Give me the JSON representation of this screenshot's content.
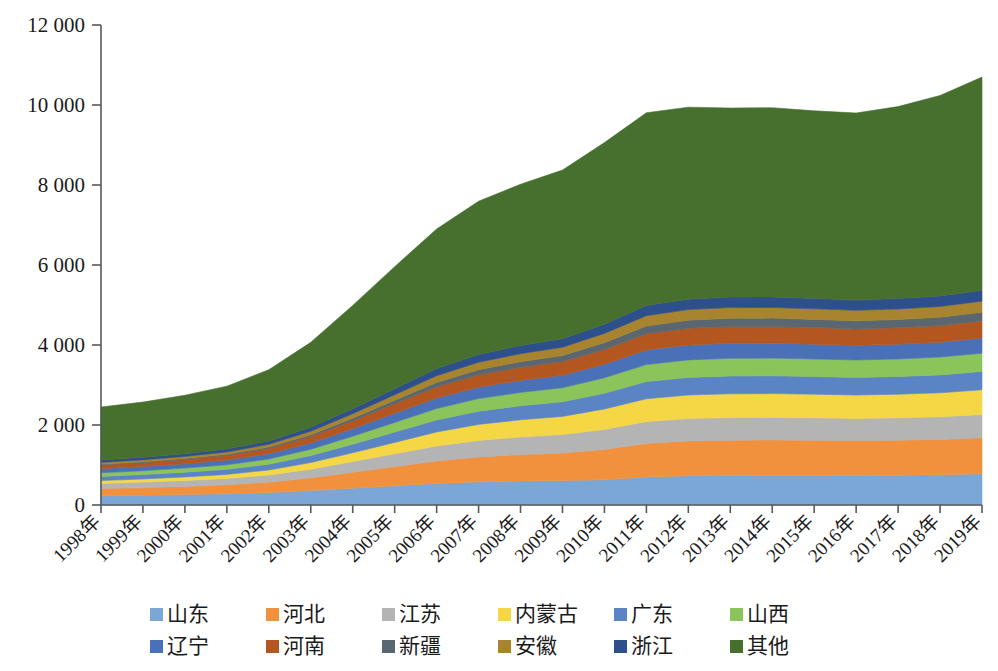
{
  "chart_data": {
    "type": "area",
    "stacked": true,
    "title": "",
    "xlabel": "",
    "ylabel": "",
    "ylim": [
      0,
      12000
    ],
    "ytick_labels": [
      "0",
      "2 000",
      "4 000",
      "6 000",
      "8 000",
      "10 000",
      "12 000"
    ],
    "ytick_values": [
      0,
      2000,
      4000,
      6000,
      8000,
      10000,
      12000
    ],
    "grid": false,
    "legend_position": "bottom",
    "categories": [
      "1998年",
      "1999年",
      "2000年",
      "2001年",
      "2002年",
      "2003年",
      "2004年",
      "2005年",
      "2006年",
      "2007年",
      "2008年",
      "2009年",
      "2010年",
      "2011年",
      "2012年",
      "2013年",
      "2014年",
      "2015年",
      "2016年",
      "2017年",
      "2018年",
      "2019年"
    ],
    "x_values": [
      1998,
      1999,
      2000,
      2001,
      2002,
      2003,
      2004,
      2005,
      2006,
      2007,
      2008,
      2009,
      2010,
      2011,
      2012,
      2013,
      2014,
      2015,
      2016,
      2017,
      2018,
      2019
    ],
    "series": [
      {
        "name": "山东",
        "color": "#7ba7d7",
        "values": [
          230,
          245,
          260,
          280,
          310,
          360,
          420,
          480,
          540,
          580,
          600,
          610,
          630,
          700,
          730,
          740,
          745,
          745,
          740,
          745,
          755,
          780
        ]
      },
      {
        "name": "河北",
        "color": "#f2913d",
        "values": [
          180,
          190,
          205,
          225,
          260,
          320,
          400,
          480,
          560,
          620,
          660,
          690,
          760,
          840,
          870,
          880,
          880,
          875,
          870,
          875,
          885,
          900
        ]
      },
      {
        "name": "江苏",
        "color": "#b4b4b4",
        "values": [
          130,
          138,
          148,
          160,
          180,
          215,
          265,
          320,
          375,
          415,
          440,
          460,
          500,
          545,
          560,
          565,
          565,
          560,
          555,
          560,
          565,
          580
        ]
      },
      {
        "name": "内蒙古",
        "color": "#f5d644",
        "values": [
          70,
          78,
          88,
          100,
          125,
          165,
          220,
          285,
          350,
          400,
          430,
          455,
          510,
          570,
          590,
          595,
          595,
          590,
          585,
          590,
          600,
          620
        ]
      },
      {
        "name": "广东",
        "color": "#5a84c4",
        "values": [
          105,
          110,
          118,
          128,
          145,
          175,
          215,
          258,
          300,
          330,
          350,
          365,
          395,
          430,
          440,
          445,
          445,
          442,
          440,
          443,
          448,
          460
        ]
      },
      {
        "name": "山西",
        "color": "#8bc45a",
        "values": [
          90,
          95,
          103,
          113,
          130,
          158,
          197,
          240,
          285,
          315,
          335,
          352,
          385,
          425,
          438,
          442,
          442,
          438,
          435,
          438,
          444,
          455
        ]
      },
      {
        "name": "辽宁",
        "color": "#4a71b8",
        "values": [
          100,
          104,
          110,
          118,
          132,
          158,
          192,
          228,
          262,
          285,
          300,
          312,
          336,
          365,
          373,
          375,
          374,
          370,
          366,
          368,
          372,
          380
        ]
      },
      {
        "name": "河南",
        "color": "#b4561f",
        "values": [
          95,
          100,
          107,
          116,
          132,
          160,
          198,
          240,
          282,
          310,
          328,
          342,
          370,
          405,
          416,
          420,
          419,
          415,
          411,
          413,
          418,
          428
        ]
      },
      {
        "name": "新疆",
        "color": "#5a6670",
        "values": [
          18,
          20,
          23,
          27,
          34,
          46,
          64,
          86,
          110,
          128,
          140,
          150,
          172,
          196,
          204,
          207,
          207,
          205,
          203,
          205,
          209,
          216
        ]
      },
      {
        "name": "安徽",
        "color": "#a8842f",
        "values": [
          45,
          48,
          52,
          58,
          68,
          85,
          110,
          138,
          166,
          186,
          198,
          208,
          230,
          256,
          264,
          267,
          267,
          264,
          262,
          264,
          268,
          276
        ]
      },
      {
        "name": "浙江",
        "color": "#2d4f8c",
        "values": [
          62,
          65,
          70,
          76,
          86,
          104,
          128,
          154,
          180,
          196,
          206,
          214,
          232,
          254,
          261,
          263,
          263,
          260,
          258,
          260,
          264,
          272
        ]
      },
      {
        "name": "其他",
        "color": "#47702f",
        "values": [
          1325,
          1380,
          1460,
          1570,
          1780,
          2120,
          2580,
          3050,
          3490,
          3830,
          4030,
          4215,
          4540,
          4820,
          4800,
          4725,
          4730,
          4690,
          4675,
          4800,
          5010,
          5330
        ]
      }
    ],
    "totals": [
      2450,
      2573,
      2744,
      2971,
      3382,
      4066,
      4989,
      5959,
      6900,
      7595,
      8017,
      8373,
      9060,
      9806,
      9946,
      9924,
      9932,
      9854,
      9800,
      9961,
      10238,
      10697
    ]
  },
  "legend": {
    "rows": [
      [
        {
          "label": "山东",
          "color": "#7ba7d7"
        },
        {
          "label": "河北",
          "color": "#f2913d"
        },
        {
          "label": "江苏",
          "color": "#b4b4b4"
        },
        {
          "label": "内蒙古",
          "color": "#f5d644"
        },
        {
          "label": "广东",
          "color": "#5a84c4"
        },
        {
          "label": "山西",
          "color": "#8bc45a"
        }
      ],
      [
        {
          "label": "辽宁",
          "color": "#4a71b8"
        },
        {
          "label": "河南",
          "color": "#b4561f"
        },
        {
          "label": "新疆",
          "color": "#5a6670"
        },
        {
          "label": "安徽",
          "color": "#a8842f"
        },
        {
          "label": "浙江",
          "color": "#2d4f8c"
        },
        {
          "label": "其他",
          "color": "#47702f"
        }
      ]
    ]
  }
}
